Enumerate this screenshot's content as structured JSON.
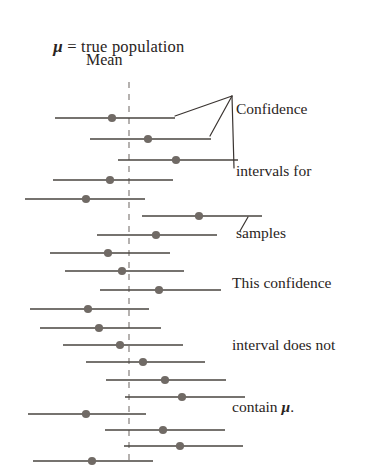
{
  "figure": {
    "width": 377,
    "height": 470,
    "background": "#ffffff"
  },
  "labels": {
    "mu_symbol": "μ",
    "mu_definition_line1": " = true population",
    "mu_definition_line2": "Mean",
    "callout_intervals_line1": "Confidence",
    "callout_intervals_line2": "intervals for",
    "callout_intervals_line3": "samples",
    "callout_note_line1": "This confidence",
    "callout_note_line2": "interval does not",
    "callout_note_line3_pre": "contain ",
    "callout_note_line3_mu": "μ",
    "callout_note_line3_post": "."
  },
  "colors": {
    "line": "#49443f",
    "dot": "#706a65",
    "dashed_axis": "#8e8986",
    "text": "#2a2422",
    "leader": "#3a3431"
  },
  "chart_data": {
    "type": "line",
    "xlabel": "",
    "ylabel": "",
    "grid": false,
    "legend": false,
    "axis": {
      "name": "true-population-mean",
      "style": "dashed-vertical",
      "x": 129,
      "y_top": 82,
      "y_bottom": 466
    },
    "annotations": [
      {
        "name": "confidence-intervals-callout",
        "text": "Confidence intervals for samples",
        "target_x": 232,
        "target_y": 96,
        "leader_lines": [
          [
            175,
            116,
            232,
            96
          ],
          [
            210,
            136,
            232,
            96
          ],
          [
            234,
            168,
            232,
            96
          ]
        ]
      },
      {
        "name": "non-containing-interval-callout",
        "text": "This confidence interval does not contain μ.",
        "target_x": 248,
        "target_y": 217,
        "leader_lines": [
          [
            248,
            217,
            240,
            231
          ]
        ]
      }
    ],
    "intervals": [
      {
        "index": 1,
        "y": 118,
        "left": 55,
        "right": 175,
        "mean": 112,
        "contains_mu": true
      },
      {
        "index": 2,
        "y": 139,
        "left": 90,
        "right": 211,
        "mean": 148,
        "contains_mu": true
      },
      {
        "index": 3,
        "y": 160,
        "left": 118,
        "right": 238,
        "mean": 176,
        "contains_mu": true
      },
      {
        "index": 4,
        "y": 180,
        "left": 53,
        "right": 173,
        "mean": 110,
        "contains_mu": true
      },
      {
        "index": 5,
        "y": 199,
        "left": 25,
        "right": 145,
        "mean": 86,
        "contains_mu": true
      },
      {
        "index": 6,
        "y": 216,
        "left": 142,
        "right": 262,
        "mean": 199,
        "contains_mu": false
      },
      {
        "index": 7,
        "y": 235,
        "left": 97,
        "right": 217,
        "mean": 156,
        "contains_mu": true
      },
      {
        "index": 8,
        "y": 253,
        "left": 50,
        "right": 170,
        "mean": 108,
        "contains_mu": true
      },
      {
        "index": 9,
        "y": 271,
        "left": 65,
        "right": 184,
        "mean": 122,
        "contains_mu": true
      },
      {
        "index": 10,
        "y": 290,
        "left": 100,
        "right": 221,
        "mean": 159,
        "contains_mu": true
      },
      {
        "index": 11,
        "y": 309,
        "left": 30,
        "right": 149,
        "mean": 88,
        "contains_mu": true
      },
      {
        "index": 12,
        "y": 328,
        "left": 40,
        "right": 161,
        "mean": 99,
        "contains_mu": true
      },
      {
        "index": 13,
        "y": 345,
        "left": 63,
        "right": 183,
        "mean": 120,
        "contains_mu": true
      },
      {
        "index": 14,
        "y": 362,
        "left": 86,
        "right": 205,
        "mean": 143,
        "contains_mu": true
      },
      {
        "index": 15,
        "y": 380,
        "left": 106,
        "right": 226,
        "mean": 165,
        "contains_mu": true
      },
      {
        "index": 16,
        "y": 397,
        "left": 125,
        "right": 245,
        "mean": 182,
        "contains_mu": true
      },
      {
        "index": 17,
        "y": 414,
        "left": 28,
        "right": 146,
        "mean": 86,
        "contains_mu": true
      },
      {
        "index": 18,
        "y": 430,
        "left": 105,
        "right": 225,
        "mean": 163,
        "contains_mu": true
      },
      {
        "index": 19,
        "y": 446,
        "left": 124,
        "right": 243,
        "mean": 180,
        "contains_mu": true
      },
      {
        "index": 20,
        "y": 461,
        "left": 33,
        "right": 153,
        "mean": 92,
        "contains_mu": true
      }
    ]
  }
}
